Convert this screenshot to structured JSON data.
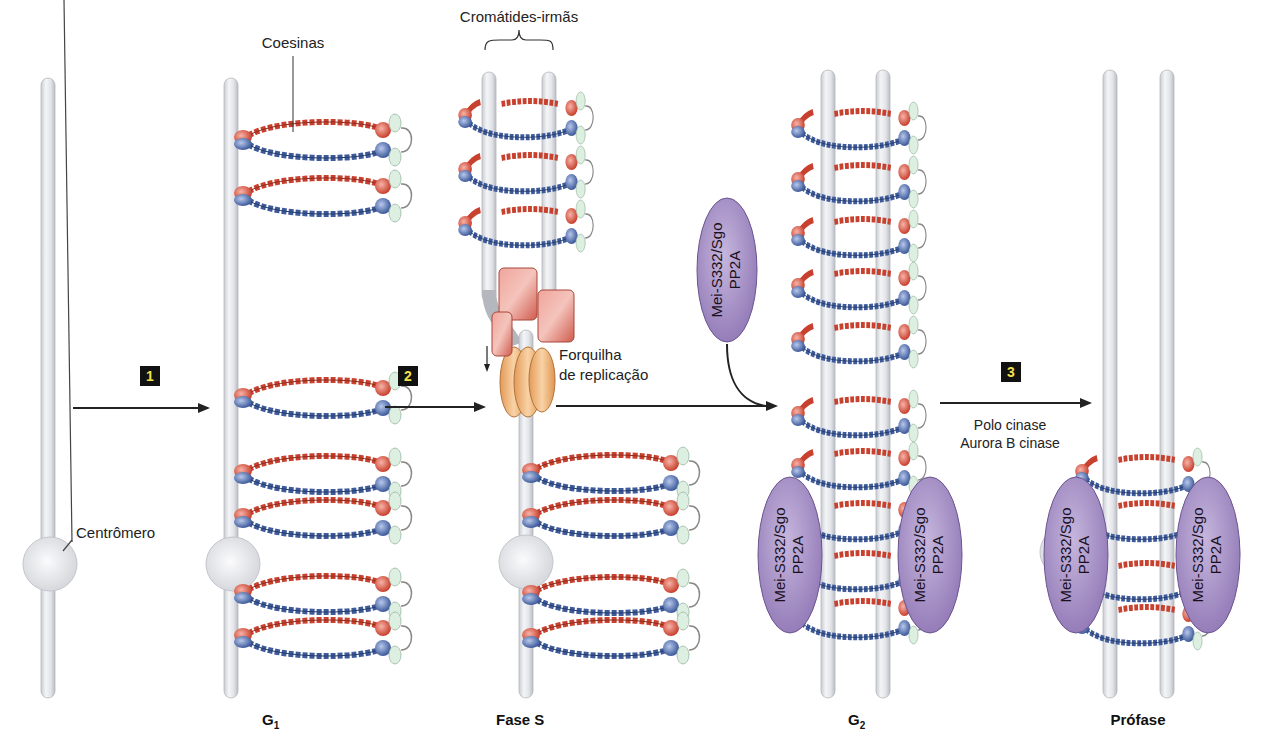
{
  "figure": {
    "labels": {
      "cohesins": "Coesinas",
      "sister_chromatids": "Cromátides-irmãs",
      "centromere": "Centrômero",
      "replication_fork_line1": "Forquilha",
      "replication_fork_line2": "de replicação",
      "kinase_line1": "Polo cinase",
      "kinase_line2": "Aurora B cinase"
    },
    "protein_complex": {
      "line1": "Mei-S332/Sgo",
      "line2": "PP2A"
    },
    "steps": [
      {
        "number": "1"
      },
      {
        "number": "2"
      },
      {
        "number": "3"
      }
    ],
    "stages": [
      {
        "label": "G",
        "sub": "1"
      },
      {
        "label": "Fase S"
      },
      {
        "label": "G",
        "sub": "2"
      },
      {
        "label": "Prófase"
      }
    ],
    "colors": {
      "chromatid": "#e4e6ea",
      "cohesin_red": "#c8412e",
      "cohesin_blue": "#3d5a9a",
      "hinge_green": "#dcefe0",
      "protein_purple": "#a58fc4",
      "fork_red": "#d9665a",
      "fork_orange": "#eeb27a",
      "step_box": "#111111",
      "step_number": "#f3e04a"
    }
  }
}
